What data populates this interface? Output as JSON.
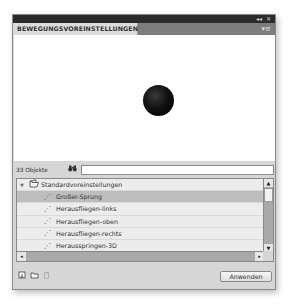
{
  "panel": {
    "title": "BEWEGUNGSVOREINSTELLUNGEN",
    "titlebar_icons": {
      "collapse": "◂◂",
      "close": "✕"
    },
    "menu_icon": "▾≡"
  },
  "preview": {
    "object": "black-ball"
  },
  "search": {
    "count_label": "33 Objekte",
    "binoculars_icon": "👓",
    "value": "",
    "placeholder": ""
  },
  "tree": {
    "folder": {
      "label": "Standardvoreinstellungen",
      "expanded": true,
      "toggle": "▼",
      "icon": "🗁"
    },
    "items": [
      {
        "label": "Großer-Sprung",
        "selected": true
      },
      {
        "label": "Herausfliegen-links",
        "selected": false
      },
      {
        "label": "Herausfliegen-oben",
        "selected": false
      },
      {
        "label": "Herausfliegen-rechts",
        "selected": false
      },
      {
        "label": "Herausspringen-3D",
        "selected": false
      }
    ],
    "item_icon": "⋰",
    "scroll_up": "▲",
    "scroll_down": "▼",
    "scroll_left": "◂",
    "scroll_right": "▸"
  },
  "footer": {
    "new_preset_icon": "⊡",
    "new_folder_icon": "▭",
    "delete_icon": "🗑",
    "apply_label": "Anwenden"
  }
}
